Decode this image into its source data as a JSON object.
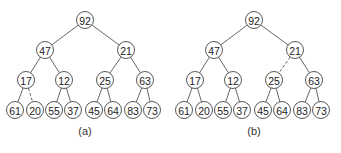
{
  "panels": [
    {
      "id": "a",
      "caption": "(a)",
      "offset_x": 0,
      "nodes": [
        {
          "value": "92",
          "x": 85,
          "y": 20
        },
        {
          "value": "47",
          "x": 45,
          "y": 50
        },
        {
          "value": "21",
          "x": 126,
          "y": 50
        },
        {
          "value": "17",
          "x": 26,
          "y": 80
        },
        {
          "value": "12",
          "x": 64,
          "y": 80
        },
        {
          "value": "25",
          "x": 105,
          "y": 80
        },
        {
          "value": "63",
          "x": 145,
          "y": 80
        },
        {
          "value": "61",
          "x": 15,
          "y": 110
        },
        {
          "value": "20",
          "x": 35,
          "y": 110
        },
        {
          "value": "55",
          "x": 54,
          "y": 110
        },
        {
          "value": "37",
          "x": 73,
          "y": 110
        },
        {
          "value": "45",
          "x": 94,
          "y": 110
        },
        {
          "value": "64",
          "x": 113,
          "y": 110
        },
        {
          "value": "83",
          "x": 133,
          "y": 110
        },
        {
          "value": "73",
          "x": 152,
          "y": 110
        }
      ],
      "edges": [
        {
          "from": 0,
          "to": 1,
          "dashed": false
        },
        {
          "from": 0,
          "to": 2,
          "dashed": false
        },
        {
          "from": 1,
          "to": 3,
          "dashed": false
        },
        {
          "from": 1,
          "to": 4,
          "dashed": false
        },
        {
          "from": 2,
          "to": 5,
          "dashed": false
        },
        {
          "from": 2,
          "to": 6,
          "dashed": false
        },
        {
          "from": 3,
          "to": 7,
          "dashed": false
        },
        {
          "from": 3,
          "to": 8,
          "dashed": true
        },
        {
          "from": 4,
          "to": 9,
          "dashed": false
        },
        {
          "from": 4,
          "to": 10,
          "dashed": false
        },
        {
          "from": 5,
          "to": 11,
          "dashed": false
        },
        {
          "from": 5,
          "to": 12,
          "dashed": false
        },
        {
          "from": 6,
          "to": 13,
          "dashed": false
        },
        {
          "from": 6,
          "to": 14,
          "dashed": false
        }
      ]
    },
    {
      "id": "b",
      "caption": "(b)",
      "offset_x": 169,
      "nodes": [
        {
          "value": "92",
          "x": 85,
          "y": 20
        },
        {
          "value": "47",
          "x": 45,
          "y": 50
        },
        {
          "value": "21",
          "x": 126,
          "y": 50
        },
        {
          "value": "17",
          "x": 26,
          "y": 80
        },
        {
          "value": "12",
          "x": 64,
          "y": 80
        },
        {
          "value": "25",
          "x": 105,
          "y": 80
        },
        {
          "value": "63",
          "x": 145,
          "y": 80
        },
        {
          "value": "61",
          "x": 15,
          "y": 110
        },
        {
          "value": "20",
          "x": 35,
          "y": 110
        },
        {
          "value": "55",
          "x": 54,
          "y": 110
        },
        {
          "value": "37",
          "x": 73,
          "y": 110
        },
        {
          "value": "45",
          "x": 94,
          "y": 110
        },
        {
          "value": "64",
          "x": 113,
          "y": 110
        },
        {
          "value": "83",
          "x": 133,
          "y": 110
        },
        {
          "value": "73",
          "x": 152,
          "y": 110
        }
      ],
      "edges": [
        {
          "from": 0,
          "to": 1,
          "dashed": false
        },
        {
          "from": 0,
          "to": 2,
          "dashed": false
        },
        {
          "from": 1,
          "to": 3,
          "dashed": false
        },
        {
          "from": 1,
          "to": 4,
          "dashed": false
        },
        {
          "from": 2,
          "to": 5,
          "dashed": true
        },
        {
          "from": 2,
          "to": 6,
          "dashed": false
        },
        {
          "from": 3,
          "to": 7,
          "dashed": false
        },
        {
          "from": 3,
          "to": 8,
          "dashed": false
        },
        {
          "from": 4,
          "to": 9,
          "dashed": false
        },
        {
          "from": 4,
          "to": 10,
          "dashed": false
        },
        {
          "from": 5,
          "to": 11,
          "dashed": false
        },
        {
          "from": 5,
          "to": 12,
          "dashed": false
        },
        {
          "from": 6,
          "to": 13,
          "dashed": false
        },
        {
          "from": 6,
          "to": 14,
          "dashed": false
        }
      ]
    }
  ],
  "style": {
    "node_radius": 8.5,
    "caption_y": 135
  }
}
